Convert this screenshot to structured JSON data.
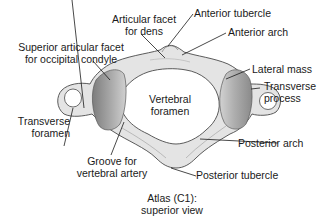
{
  "figure": {
    "title_line1": "Atlas (C1):",
    "title_line2": "superior view"
  },
  "labels": {
    "articular_facet_dens_1": "Articular facet",
    "articular_facet_dens_2": "for dens",
    "anterior_tubercle": "Anterior tubercle",
    "anterior_arch": "Anterior arch",
    "superior_facet_1": "Superior articular facet",
    "superior_facet_2": "for occipital condyle",
    "lateral_mass": "Lateral mass",
    "transverse_process_1": "Transverse",
    "transverse_process_2": "process",
    "vertebral_foramen_1": "Vertebral",
    "vertebral_foramen_2": "foramen",
    "transverse_foramen_1": "Transverse",
    "transverse_foramen_2": "foramen",
    "groove_1": "Groove for",
    "groove_2": "vertebral artery",
    "posterior_arch": "Posterior arch",
    "posterior_tubercle": "Posterior tubercle"
  },
  "colors": {
    "bone_fill": "#e4e4e4",
    "bone_stroke": "#4a4a4a",
    "facet_dark": "#8a8a8a",
    "facet_light": "#c8c8c8",
    "leader_line": "#1a1a1a"
  }
}
